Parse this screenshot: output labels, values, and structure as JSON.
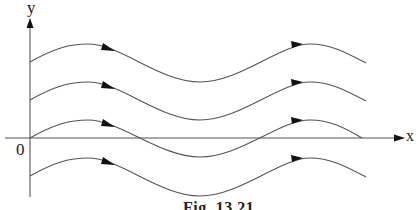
{
  "figure": {
    "caption": "Fig. 13.21",
    "axes": {
      "x_label": "x",
      "y_label": "y",
      "origin_label": "0"
    },
    "colors": {
      "line": "#555555",
      "arrow": "#111111",
      "text": "#222222",
      "background": "#ffffff"
    },
    "curves": [
      {
        "name": "streamline-1",
        "start_y": 62,
        "peak_y": 44,
        "trough_y": 82
      },
      {
        "name": "streamline-2",
        "start_y": 100,
        "peak_y": 82,
        "trough_y": 120
      },
      {
        "name": "streamline-3",
        "start_y": 138,
        "peak_y": 120,
        "trough_y": 157
      },
      {
        "name": "streamline-4",
        "start_y": 176,
        "peak_y": 158,
        "trough_y": 196
      }
    ]
  }
}
